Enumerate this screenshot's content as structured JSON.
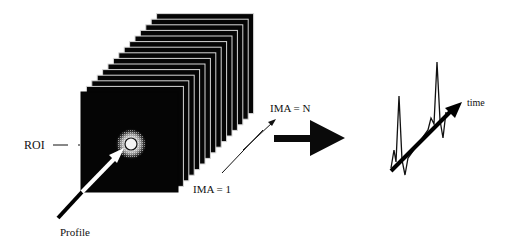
{
  "diagram": {
    "labels": {
      "roi": "ROI",
      "profile": "Profile",
      "ima_first": "IMA = 1",
      "ima_last": "IMA = N",
      "time": "time"
    },
    "stack": {
      "frame_count": 15,
      "front_frame": {
        "x": 81,
        "y": 92,
        "w": 97,
        "h": 100
      },
      "offset_per_frame": {
        "dx": 5.4,
        "dy": -5.6
      }
    },
    "colors": {
      "frame": "#050505",
      "frame_edge": "#d8d8d8",
      "background": "#ffffff",
      "ink": "#111111"
    },
    "curve": {
      "x": [
        391,
        394,
        396,
        399,
        402,
        405,
        408,
        428,
        431,
        434,
        437,
        440,
        443,
        446
      ],
      "y": [
        168,
        150,
        162,
        96,
        160,
        175,
        158,
        130,
        118,
        124,
        62,
        120,
        138,
        112
      ]
    }
  }
}
